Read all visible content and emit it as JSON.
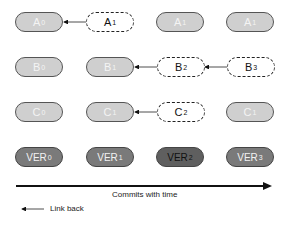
{
  "diagram": {
    "rows": [
      {
        "name": "A",
        "nodes": [
          {
            "base": "A",
            "sub": "0",
            "style": "solid"
          },
          {
            "base": "A",
            "sub": "1",
            "style": "dashed"
          },
          {
            "base": "A",
            "sub": "1",
            "style": "solid"
          },
          {
            "base": "A",
            "sub": "1",
            "style": "solid"
          }
        ]
      },
      {
        "name": "B",
        "nodes": [
          {
            "base": "B",
            "sub": "0",
            "style": "solid"
          },
          {
            "base": "B",
            "sub": "1",
            "style": "solid"
          },
          {
            "base": "B",
            "sub": "2",
            "style": "dashed"
          },
          {
            "base": "B",
            "sub": "3",
            "style": "dashed"
          }
        ]
      },
      {
        "name": "C",
        "nodes": [
          {
            "base": "C",
            "sub": "0",
            "style": "solid"
          },
          {
            "base": "C",
            "sub": "1",
            "style": "solid"
          },
          {
            "base": "C",
            "sub": "2",
            "style": "dashed"
          },
          {
            "base": "C",
            "sub": "1",
            "style": "solid"
          }
        ]
      },
      {
        "name": "VER",
        "nodes": [
          {
            "base": "VER",
            "sub": "0",
            "style": "ver"
          },
          {
            "base": "VER",
            "sub": "1",
            "style": "ver"
          },
          {
            "base": "VER",
            "sub": "2",
            "style": "ver-dark"
          },
          {
            "base": "VER",
            "sub": "3",
            "style": "ver"
          }
        ]
      }
    ],
    "links": [
      {
        "from": "A1 (col 2)",
        "to": "A0 (col 1)"
      },
      {
        "from": "B2 (col 3)",
        "to": "B1 (col 2)"
      },
      {
        "from": "B3 (col 4)",
        "to": "B2 (col 3)"
      },
      {
        "from": "C2 (col 3)",
        "to": "C1 (col 2)"
      }
    ],
    "timeline_label": "Commits with time",
    "legend_label": "Link back"
  }
}
